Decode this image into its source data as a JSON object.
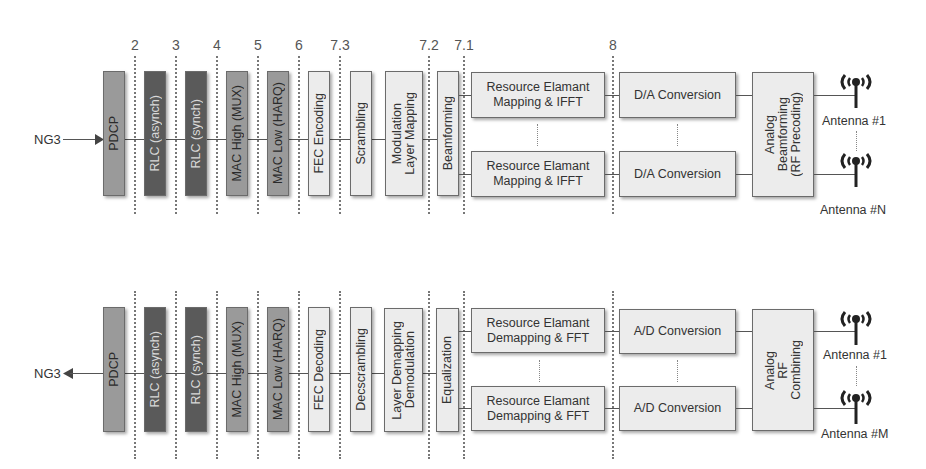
{
  "colors": {
    "dark_block": "#5a5a5a",
    "mid_block": "#9a9a9a",
    "light_block": "#ececec",
    "line": "#555555",
    "split_line": "#777777"
  },
  "split_options": [
    "2",
    "3",
    "4",
    "5",
    "6",
    "7.3",
    "7.2",
    "7.1",
    "8"
  ],
  "downlink": {
    "interface": "NG3",
    "blocks": {
      "pdcp": "PDCP",
      "rlc_async": "RLC (asynch)",
      "rlc_sync": "RLC (synch)",
      "mac_high": "MAC High (MUX)",
      "mac_low": "MAC Low (HARQ)",
      "fec": "FEC Encoding",
      "scrambling": "Scrambling",
      "modulation_l1": "Modulation",
      "modulation_l2": "Layer Mapping",
      "beamforming": "Beamforming",
      "re_l1": "Resource Elamant",
      "re_l2": "Mapping & IFFT",
      "da": "D/A Conversion",
      "analog_l1": "Analog",
      "analog_l2": "Beamforming",
      "analog_l3": "(RF Precoding)"
    },
    "antennas": [
      "Antenna #1",
      "Antenna #N"
    ]
  },
  "uplink": {
    "interface": "NG3",
    "blocks": {
      "pdcp": "PDCP",
      "rlc_async": "RLC (asynch)",
      "rlc_sync": "RLC (synch)",
      "mac_high": "MAC High (MUX)",
      "mac_low": "MAC Low (HARQ)",
      "fec": "FEC Decoding",
      "descrambling": "Decscrambling",
      "demod_l1": "Layer Demapping",
      "demod_l2": "Demodulation",
      "equalization": "Equalization",
      "re_l1": "Resource Elamant",
      "re_l2": "Demapping & FFT",
      "ad": "A/D Conversion",
      "analog_l1": "Analog",
      "analog_l2": "RF",
      "analog_l3": "Combining"
    },
    "antennas": [
      "Antenna #1",
      "Antenna #M"
    ]
  }
}
